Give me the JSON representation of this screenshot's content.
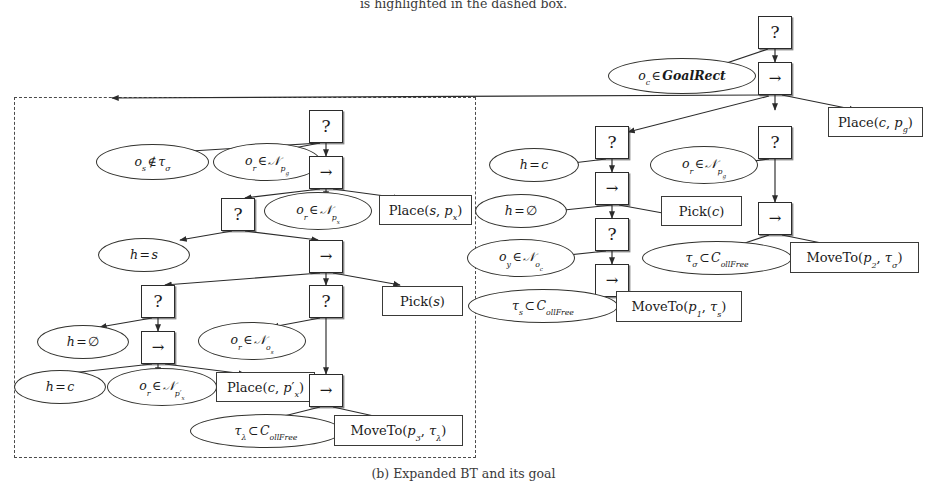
{
  "figure": {
    "caption_top": "is highlighted in the dashed box.",
    "caption_bottom": "(b) Expanded BT and its goal",
    "dashed_box_label": "dashed-highlight-region",
    "stroke_color": "#2b2b2b",
    "background_color": "#ffffff"
  },
  "legend": {
    "fallback_symbol": "?",
    "sequence_symbol": "→"
  },
  "nodes": {
    "root": {
      "type": "fallback",
      "label": "?"
    },
    "r_seq_top": {
      "type": "sequence",
      "label": "→"
    },
    "r_cond_goalrect": {
      "type": "condition",
      "label": "o_c ∈ GoalRect"
    },
    "r_act_place_cpg": {
      "type": "action",
      "label": "Place(c, p_g)"
    },
    "r_fb_left": {
      "type": "fallback",
      "label": "?"
    },
    "r_fb_right": {
      "type": "fallback",
      "label": "?"
    },
    "r_cond_h_c": {
      "type": "condition",
      "label": "h = c"
    },
    "r_seq_a": {
      "type": "sequence",
      "label": "→"
    },
    "r_cond_or_npg": {
      "type": "condition",
      "label": "o_r ∈ N_{p_g}"
    },
    "r_act_pick_c": {
      "type": "action",
      "label": "Pick(c)"
    },
    "r_seq_b": {
      "type": "sequence",
      "label": "→"
    },
    "r_cond_h_empty": {
      "type": "condition",
      "label": "h = ∅"
    },
    "r_fb_inner": {
      "type": "fallback",
      "label": "?"
    },
    "r_cond_tau_sigma": {
      "type": "condition",
      "label": "τ_σ ⊂ C_ollFree"
    },
    "r_act_moveto_p2": {
      "type": "action",
      "label": "MoveTo(p_2, τ_σ)"
    },
    "r_cond_oy_noc": {
      "type": "condition",
      "label": "o_y ∈ N_{o_c}"
    },
    "r_seq_c": {
      "type": "sequence",
      "label": "→"
    },
    "r_cond_tau_s": {
      "type": "condition",
      "label": "τ_s ⊂ C_ollFree"
    },
    "r_act_moveto_p1": {
      "type": "action",
      "label": "MoveTo(p_1, τ_s)"
    },
    "l_fb_top": {
      "type": "fallback",
      "label": "?"
    },
    "l_cond_os_notin": {
      "type": "condition",
      "label": "o_s ∉ τ_σ"
    },
    "l_cond_or_npg": {
      "type": "condition",
      "label": "o_r ∈ N_{p_g}"
    },
    "l_seq_top": {
      "type": "sequence",
      "label": "→"
    },
    "l_fb_a": {
      "type": "fallback",
      "label": "?"
    },
    "l_cond_or_npx": {
      "type": "condition",
      "label": "o_r ∈ N_{p_x}"
    },
    "l_act_place_spx": {
      "type": "action",
      "label": "Place(s, p_x)"
    },
    "l_cond_h_s": {
      "type": "condition",
      "label": "h = s"
    },
    "l_seq_b": {
      "type": "sequence",
      "label": "→"
    },
    "l_fb_b": {
      "type": "fallback",
      "label": "?"
    },
    "l_fb_c": {
      "type": "fallback",
      "label": "?"
    },
    "l_act_pick_s": {
      "type": "action",
      "label": "Pick(s)"
    },
    "l_cond_h_empty": {
      "type": "condition",
      "label": "h = ∅"
    },
    "l_seq_c": {
      "type": "sequence",
      "label": "→"
    },
    "l_cond_or_nos": {
      "type": "condition",
      "label": "o_r ∈ N_{o_s}"
    },
    "l_cond_h_c": {
      "type": "condition",
      "label": "h = c"
    },
    "l_cond_or_npxp": {
      "type": "condition",
      "label": "o_r ∈ N_{p'_x}"
    },
    "l_act_place_cpxp": {
      "type": "action",
      "label": "Place(c, p'_x)"
    },
    "l_seq_d": {
      "type": "sequence",
      "label": "→"
    },
    "l_cond_tau_lambda": {
      "type": "condition",
      "label": "τ_λ ⊂ C_ollFree"
    },
    "l_act_moveto_p3": {
      "type": "action",
      "label": "MoveTo(p_3, τ_λ)"
    }
  }
}
